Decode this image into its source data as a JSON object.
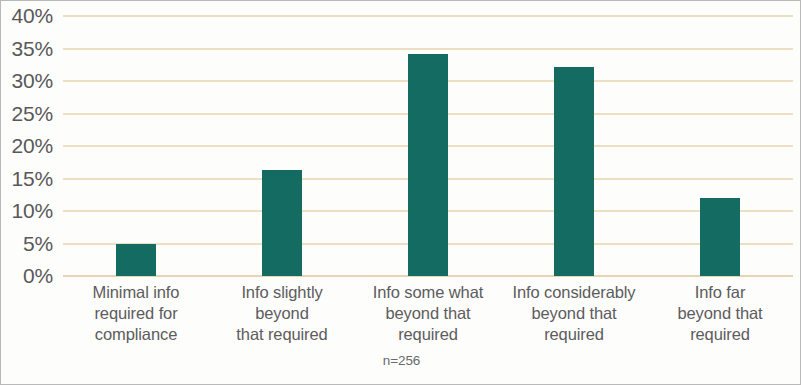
{
  "chart_data": {
    "type": "bar",
    "title": "",
    "subtitle": "",
    "xlabel": "",
    "ylabel": "",
    "categories": [
      "Minimal info required for compliance",
      "Info slightly beyond that required",
      "Info some what beyond that required",
      "Info considerably beyond that required",
      "Info far beyond that required"
    ],
    "category_lines": [
      [
        "Minimal info",
        "required for",
        "compliance"
      ],
      [
        "Info slightly",
        "beyond",
        "that required"
      ],
      [
        "Info some what",
        "beyond that",
        "required"
      ],
      [
        "Info considerably",
        "beyond that",
        "required"
      ],
      [
        "Info far",
        "beyond that",
        "required"
      ]
    ],
    "values": [
      5.0,
      16.3,
      34.1,
      32.2,
      12.0
    ],
    "ylim": [
      0,
      40
    ],
    "ytick_values": [
      0,
      5,
      10,
      15,
      20,
      25,
      30,
      35,
      40
    ],
    "ytick_labels": [
      "0%",
      "5%",
      "10%",
      "15%",
      "20%",
      "25%",
      "30%",
      "35%",
      "40%"
    ],
    "grid": true,
    "legend": false,
    "annotation": "n=256",
    "colors": {
      "bar": "#136b62",
      "gridline": "#ecdfc2",
      "axis_text": "#58585a",
      "label_text": "#5c5c5e",
      "background": "#fdfdfb",
      "border": "#b9b9b9"
    }
  }
}
